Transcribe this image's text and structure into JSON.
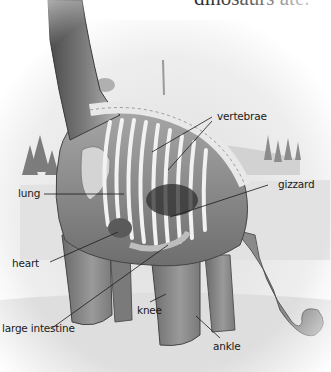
{
  "caption": {
    "text": "dinosaurs ate."
  },
  "illustration": {
    "subject": "sauropod dinosaur cutaway anatomy",
    "colors": {
      "ink": "#1a1a1a",
      "skin_dark": "#5a5a5a",
      "skin_mid": "#8e8e8e",
      "skin_light": "#cfcfcf",
      "sky": "#ececec",
      "ground": "#e4e4e4"
    }
  },
  "labels": [
    {
      "id": "vertebrae",
      "text": "vertebrae"
    },
    {
      "id": "lung",
      "text": "lung"
    },
    {
      "id": "gizzard",
      "text": "gizzard"
    },
    {
      "id": "heart",
      "text": "heart"
    },
    {
      "id": "large-intestine",
      "text": "large intestine"
    },
    {
      "id": "knee",
      "text": "knee"
    },
    {
      "id": "ankle",
      "text": "ankle"
    }
  ]
}
